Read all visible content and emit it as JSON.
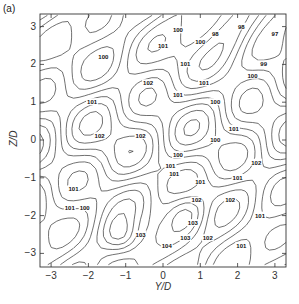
{
  "chart_data": {
    "type": "contour",
    "panel_label": "(a)",
    "title": "",
    "xlabel": "Y/D",
    "ylabel": "Z/D",
    "xlim": [
      -3.3,
      3.3
    ],
    "ylim": [
      -3.3,
      3.3
    ],
    "xticks": [
      -3,
      -2,
      -1,
      0,
      1,
      2,
      3
    ],
    "yticks": [
      -3,
      -2,
      -1,
      0,
      1,
      2,
      3
    ],
    "xtick_labels": [
      "−3",
      "−2",
      "−1",
      "0",
      "1",
      "2",
      "3"
    ],
    "ytick_labels": [
      "−3",
      "−2",
      "−1",
      "0",
      "1",
      "2",
      "3"
    ],
    "grid": false,
    "legend": null,
    "contour_levels_labeled": [
      97,
      98,
      99,
      100,
      101,
      102,
      103
    ],
    "contour_labels": [
      {
        "value": "100",
        "y": -1.6,
        "z": 2.2
      },
      {
        "value": "101",
        "y": 0.0,
        "z": 2.5
      },
      {
        "value": "101",
        "y": 0.6,
        "z": 2.0
      },
      {
        "value": "102",
        "y": -0.4,
        "z": 1.5
      },
      {
        "value": "101",
        "y": 0.4,
        "z": 1.2
      },
      {
        "value": "101",
        "y": -1.9,
        "z": 1.0
      },
      {
        "value": "102",
        "y": -1.7,
        "z": 0.1
      },
      {
        "value": "102",
        "y": -0.6,
        "z": 0.1
      },
      {
        "value": "100",
        "y": 1.0,
        "z": 2.6
      },
      {
        "value": "98",
        "y": 1.4,
        "z": 2.8
      },
      {
        "value": "100",
        "y": 0.4,
        "z": 2.9
      },
      {
        "value": "98",
        "y": 2.1,
        "z": 3.0
      },
      {
        "value": "97",
        "y": 3.0,
        "z": 2.8
      },
      {
        "value": "99",
        "y": 2.7,
        "z": 2.0
      },
      {
        "value": "100",
        "y": 2.4,
        "z": 1.7
      },
      {
        "value": "101",
        "y": 1.1,
        "z": 1.5
      },
      {
        "value": "100",
        "y": 1.4,
        "z": 1.0
      },
      {
        "value": "101",
        "y": 1.9,
        "z": 0.3
      },
      {
        "value": "100",
        "y": 1.4,
        "z": 0.0
      },
      {
        "value": "100",
        "y": 0.4,
        "z": -0.4
      },
      {
        "value": "102",
        "y": 2.5,
        "z": -0.6
      },
      {
        "value": "101",
        "y": 0.3,
        "z": -0.9
      },
      {
        "value": "101",
        "y": 1.0,
        "z": -1.1
      },
      {
        "value": "102",
        "y": 0.9,
        "z": -1.6
      },
      {
        "value": "103",
        "y": 0.8,
        "z": -2.2
      },
      {
        "value": "101",
        "y": 2.0,
        "z": -1.0
      },
      {
        "value": "102",
        "y": 1.8,
        "z": -1.6
      },
      {
        "value": "101",
        "y": 2.6,
        "z": -2.0
      },
      {
        "value": "101",
        "y": 2.1,
        "z": -2.8
      },
      {
        "value": "104",
        "y": 0.1,
        "z": -2.8
      },
      {
        "value": "103",
        "y": 0.6,
        "z": -2.6
      },
      {
        "value": "102",
        "y": 1.2,
        "z": -2.6
      },
      {
        "value": "101",
        "y": -2.4,
        "z": -1.3
      },
      {
        "value": "101",
        "y": -2.5,
        "z": -1.8
      },
      {
        "value": "100",
        "y": -2.1,
        "z": -1.8
      },
      {
        "value": "103",
        "y": -0.6,
        "z": -2.5
      },
      {
        "value": "101",
        "y": 0.2,
        "z": -0.7
      }
    ],
    "note": "Contour map of a scalar field (values ~97–104) over the Y/D–Z/D cross-section, range approximately −3.3 to 3.3 on both axes."
  }
}
